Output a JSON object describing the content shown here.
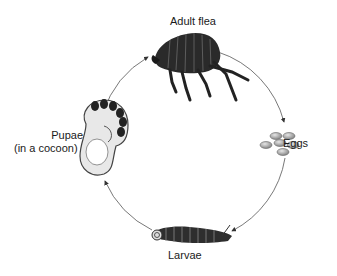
{
  "diagram": {
    "type": "life-cycle",
    "stages": [
      {
        "id": "adult",
        "label": "Adult flea",
        "icon": "flea-icon"
      },
      {
        "id": "eggs",
        "label": "Eggs",
        "icon": "eggs-icon"
      },
      {
        "id": "larvae",
        "label": "Larvae",
        "icon": "larva-icon"
      },
      {
        "id": "pupae",
        "label_line1": "Pupae",
        "label_line2": "(in a cocoon)",
        "icon": "pupa-cocoon-icon"
      }
    ],
    "flow": [
      "adult",
      "eggs",
      "larvae",
      "pupae",
      "adult"
    ],
    "caption_fragment": "",
    "colors": {
      "stroke": "#555555",
      "dark": "#2a2a2a",
      "egg": "#9a9a9a"
    }
  }
}
